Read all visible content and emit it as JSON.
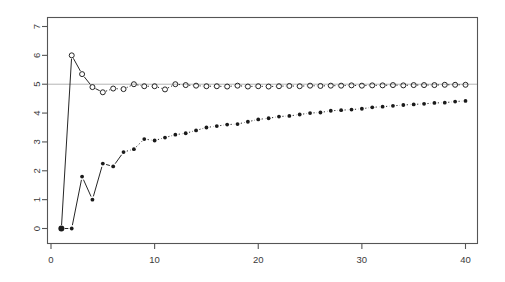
{
  "chart_data": {
    "type": "scatter",
    "title": "",
    "xlabel": "",
    "ylabel": "",
    "xlim": [
      0.2,
      41.2
    ],
    "ylim": [
      -0.35,
      7.35
    ],
    "xticks": [
      0,
      10,
      20,
      30,
      40
    ],
    "yticks": [
      0,
      1,
      2,
      3,
      4,
      5,
      6,
      7
    ],
    "xtick_labels": [
      "0",
      "10",
      "20",
      "30",
      "40"
    ],
    "ytick_labels": [
      "0",
      "1",
      "2",
      "3",
      "4",
      "5",
      "6",
      "7"
    ],
    "grid": false,
    "legend": "none",
    "frame": true,
    "annotations": [
      {
        "type": "hline",
        "y": 5,
        "color": "#aaaaaa",
        "label": "reference line at y = 5"
      }
    ],
    "x": [
      1,
      2,
      3,
      4,
      5,
      6,
      7,
      8,
      9,
      10,
      11,
      12,
      13,
      14,
      15,
      16,
      17,
      18,
      19,
      20,
      21,
      22,
      23,
      24,
      25,
      26,
      27,
      28,
      29,
      30,
      31,
      32,
      33,
      34,
      35,
      36,
      37,
      38,
      39,
      40
    ],
    "series": [
      {
        "name": "open-circles",
        "marker": "open-circle",
        "color": "#1a1a1a",
        "line": "solid-then-dashed",
        "values": [
          0.0,
          6.0,
          5.35,
          4.9,
          4.72,
          4.85,
          4.83,
          5.0,
          4.93,
          4.93,
          4.82,
          5.0,
          4.97,
          4.95,
          4.93,
          4.93,
          4.92,
          4.95,
          4.92,
          4.93,
          4.92,
          4.93,
          4.94,
          4.93,
          4.95,
          4.94,
          4.95,
          4.95,
          4.96,
          4.95,
          4.96,
          4.96,
          4.97,
          4.96,
          4.97,
          4.97,
          4.97,
          4.98,
          4.98,
          4.98
        ]
      },
      {
        "name": "filled-dots",
        "marker": "filled-dot",
        "color": "#1a1a1a",
        "line": "solid-then-dotted",
        "values": [
          0.0,
          0.0,
          1.8,
          1.0,
          2.25,
          2.15,
          2.65,
          2.75,
          3.1,
          3.05,
          3.15,
          3.25,
          3.3,
          3.4,
          3.5,
          3.55,
          3.6,
          3.62,
          3.7,
          3.78,
          3.82,
          3.88,
          3.9,
          3.95,
          4.0,
          4.02,
          4.08,
          4.1,
          4.12,
          4.15,
          4.2,
          4.22,
          4.25,
          4.28,
          4.3,
          4.32,
          4.35,
          4.36,
          4.4,
          4.42
        ]
      }
    ]
  },
  "axes": {
    "x_axis_name": "x-axis",
    "y_axis_name": "y-axis"
  }
}
